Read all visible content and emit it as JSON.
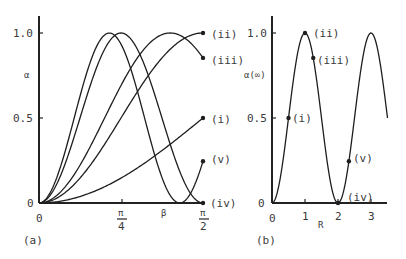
{
  "chart_data": [
    {
      "panel": "(a)",
      "type": "line",
      "title": "",
      "xlabel": "β",
      "ylabel": "α",
      "xlim": [
        0,
        1.5708
      ],
      "ylim": [
        0,
        1.05
      ],
      "x_tick_labels": [
        "0",
        "π/4",
        "π/2"
      ],
      "y_tick_labels": [
        "0",
        "0.5",
        "1.0"
      ],
      "grid": false,
      "legend": "inline end labels",
      "formula_hint": "α = sin²(R·β) for each curve, R = 0.5, 1.0, 1.25, 2.0, 2.33",
      "series": [
        {
          "name": "(i)",
          "R": 0.5,
          "endpoint_value": 0.5
        },
        {
          "name": "(ii)",
          "R": 1.0,
          "endpoint_value": 1.0
        },
        {
          "name": "(iii)",
          "R": 1.25,
          "endpoint_value": 0.85
        },
        {
          "name": "(iv)",
          "R": 2.0,
          "endpoint_value": 0.0
        },
        {
          "name": "(v)",
          "R": 2.33,
          "endpoint_value": 0.25
        }
      ]
    },
    {
      "panel": "(b)",
      "type": "line",
      "title": "",
      "xlabel": "R",
      "ylabel": "α(∞)",
      "xlim": [
        0,
        3.5
      ],
      "ylim": [
        0,
        1.05
      ],
      "x_tick_labels": [
        "0",
        "1",
        "2",
        "3"
      ],
      "y_tick_labels": [
        "0",
        "0.5",
        "1.0"
      ],
      "grid": false,
      "formula_hint": "α(∞) = sin²(πR/2)",
      "marked_points": [
        {
          "label": "(i)",
          "R": 0.5,
          "value": 0.5
        },
        {
          "label": "(ii)",
          "R": 1.0,
          "value": 1.0
        },
        {
          "label": "(iii)",
          "R": 1.25,
          "value": 0.85
        },
        {
          "label": "(iv)",
          "R": 2.0,
          "value": 0.0
        },
        {
          "label": "(v)",
          "R": 2.33,
          "value": 0.25
        }
      ]
    }
  ],
  "panel_a": {
    "panel_label": "(a)",
    "ylabel": "α",
    "xlabel": "β",
    "y_ticks": {
      "t0": "0",
      "t05": "0.5",
      "t10": "1.0"
    },
    "x_ticks": {
      "t0": "0",
      "pi_num": "π",
      "quarter_den": "4",
      "half_den": "2"
    },
    "curve_labels": {
      "i": "(i)",
      "ii": "(ii)",
      "iii": "(iii)",
      "iv": "(iv)",
      "v": "(v)"
    }
  },
  "panel_b": {
    "panel_label": "(b)",
    "ylabel": "α(∞)",
    "xlabel": "R",
    "y_ticks": {
      "t0": "0",
      "t05": "0.5",
      "t10": "1.0"
    },
    "x_ticks": {
      "t0": "0",
      "t1": "1",
      "t2": "2",
      "t3": "3"
    },
    "point_labels": {
      "i": "(i)",
      "ii": "(ii)",
      "iii": "(iii)",
      "iv": "(iv)",
      "v": "(v)"
    }
  }
}
